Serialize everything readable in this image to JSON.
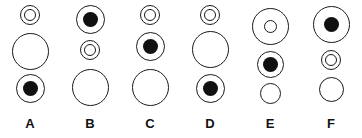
{
  "figure": {
    "type": "abstract-reasoning-matrix",
    "background_color": "#ffffff",
    "stroke_color": "#1a1a1a",
    "fill_color": "#111111",
    "width": 362,
    "height": 138,
    "columns": [
      {
        "label": "A",
        "x": 0,
        "cells": [
          {
            "name": "small-double-ring",
            "kind": "double-ring",
            "outer": 20,
            "inner": 12,
            "top": 5
          },
          {
            "name": "large-plain-circle",
            "kind": "plain",
            "outer": 37,
            "top": 33
          },
          {
            "name": "medium-dot-circle",
            "kind": "dot",
            "outer": 29,
            "inner": 15,
            "top": 74
          }
        ]
      },
      {
        "label": "B",
        "x": 60,
        "cells": [
          {
            "name": "medium-dot-circle",
            "kind": "dot",
            "outer": 29,
            "inner": 15,
            "top": 5
          },
          {
            "name": "small-double-ring",
            "kind": "double-ring",
            "outer": 20,
            "inner": 12,
            "top": 40
          },
          {
            "name": "large-plain-circle",
            "kind": "plain",
            "outer": 37,
            "top": 69
          }
        ]
      },
      {
        "label": "C",
        "x": 120,
        "cells": [
          {
            "name": "small-double-ring",
            "kind": "double-ring",
            "outer": 20,
            "inner": 12,
            "top": 5
          },
          {
            "name": "medium-dot-circle",
            "kind": "dot",
            "outer": 29,
            "inner": 15,
            "top": 32
          },
          {
            "name": "large-plain-circle",
            "kind": "plain",
            "outer": 37,
            "top": 69
          }
        ]
      },
      {
        "label": "D",
        "x": 180,
        "cells": [
          {
            "name": "small-double-ring",
            "kind": "double-ring",
            "outer": 20,
            "inner": 12,
            "top": 5
          },
          {
            "name": "large-plain-circle",
            "kind": "plain",
            "outer": 37,
            "top": 31
          },
          {
            "name": "medium-dot-circle",
            "kind": "dot",
            "outer": 29,
            "inner": 15,
            "top": 74
          }
        ]
      },
      {
        "label": "E",
        "x": 240,
        "cells": [
          {
            "name": "large-hollow-center-circle",
            "kind": "hollow",
            "outer": 37,
            "inner": 13,
            "top": 8
          },
          {
            "name": "medium-dot-circle",
            "kind": "dot",
            "outer": 27,
            "inner": 15,
            "top": 51
          },
          {
            "name": "small-plain-circle",
            "kind": "plain",
            "outer": 21,
            "top": 83
          }
        ]
      },
      {
        "label": "F",
        "x": 301,
        "cells": [
          {
            "name": "large-dot-circle",
            "kind": "dot",
            "outer": 37,
            "inner": 15,
            "top": 6
          },
          {
            "name": "small-double-ring",
            "kind": "double-ring",
            "outer": 20,
            "inner": 12,
            "top": 50
          },
          {
            "name": "medium-plain-circle",
            "kind": "plain",
            "outer": 25,
            "top": 77
          }
        ]
      }
    ],
    "label_row": {
      "name": "column-labels",
      "top": 116,
      "labels": [
        "A",
        "B",
        "C",
        "D",
        "E",
        "F"
      ]
    }
  }
}
